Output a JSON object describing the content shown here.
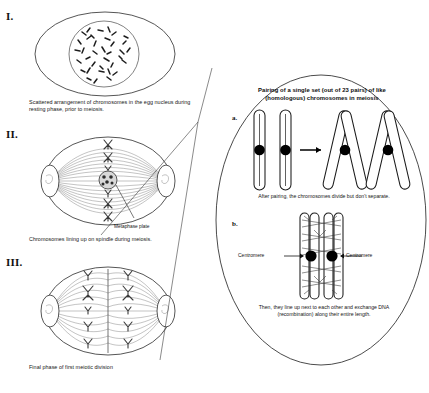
{
  "figure": {
    "sections": [
      {
        "numeral": "I.",
        "caption": "Scattered arrangement of chromosomes in the egg nucleus during resting phase, prior to meiosis."
      },
      {
        "numeral": "II.",
        "caption": "Chromosomes lining up on spindle during meiosis.",
        "annotation": "Metaphase plate"
      },
      {
        "numeral": "III.",
        "caption": "Final phase of first meiotic division"
      }
    ]
  },
  "callout": {
    "title": "Pairing of a single set (out of 23 pairs) of like (homologous) chromosomes in meiosis",
    "panels": [
      {
        "letter": "a.",
        "caption": "After pairing, the chromosomes divide but don't separate."
      },
      {
        "letter": "b.",
        "caption": "Then, they line up next to each other and exchange DNA (recombination) along their entire length.",
        "label_left": "Centromere",
        "label_right": "Centromere"
      }
    ]
  },
  "colors": {
    "ink": "#2b2b2b",
    "fill": "#ffffff",
    "centromere": "#000000",
    "background": "#ffffff",
    "fiber": "#555555"
  }
}
